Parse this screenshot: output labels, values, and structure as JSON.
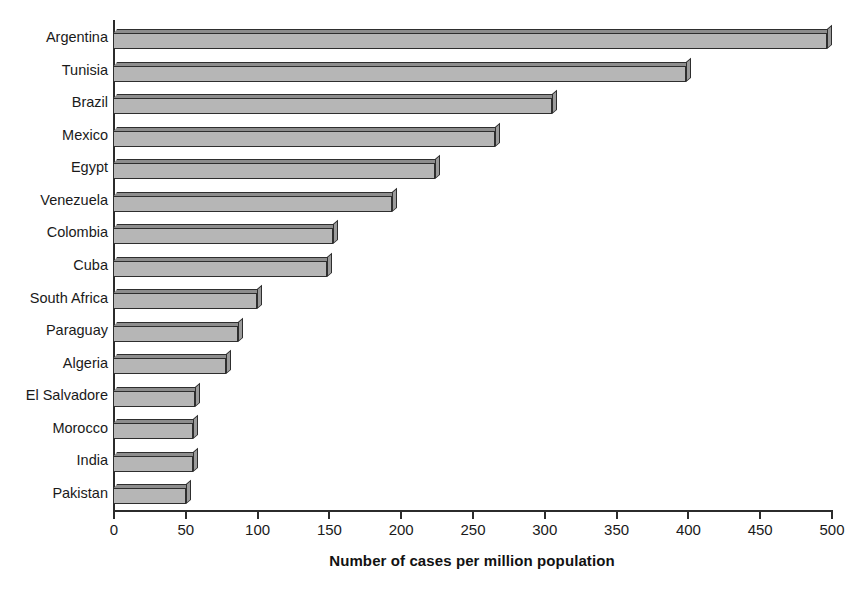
{
  "chart_data": {
    "type": "bar",
    "orientation": "horizontal",
    "title": "",
    "xlabel": "Number of cases per million population",
    "ylabel": "",
    "xlim": [
      0,
      500
    ],
    "xticks": [
      0,
      50,
      100,
      150,
      200,
      250,
      300,
      350,
      400,
      450,
      500
    ],
    "xtick_labels": [
      "0",
      "50",
      "100",
      "150",
      "200",
      "250",
      "300",
      "350",
      "400",
      "450",
      "500"
    ],
    "grid": false,
    "legend": false,
    "legend_position": "none",
    "bar_style": "3d",
    "categories": [
      "Argentina",
      "Tunisia",
      "Brazil",
      "Mexico",
      "Egypt",
      "Venezuela",
      "Colombia",
      "Cuba",
      "South Africa",
      "Paraguay",
      "Algeria",
      "El Salvadore",
      "Morocco",
      "India",
      "Pakistan"
    ],
    "values": [
      497,
      399,
      306,
      266,
      224,
      194,
      153,
      149,
      100,
      87,
      79,
      57,
      56,
      56,
      51
    ],
    "colors": {
      "bar_face": "#b6b6b6",
      "bar_top": "#8d8d8d",
      "bar_side": "#9b9b9b",
      "bar_outline": "#2e2e2e",
      "axis": "#2b2b2b",
      "text": "#1a1a1a",
      "background": "#ffffff"
    }
  }
}
